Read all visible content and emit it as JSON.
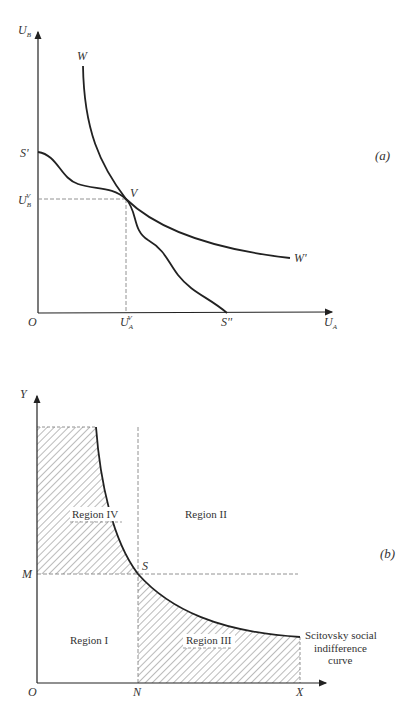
{
  "panel_a": {
    "tag": "(a)",
    "y_axis_label": "U",
    "y_axis_sub": "B",
    "x_axis_label": "U",
    "x_axis_sub": "A",
    "origin": "O",
    "curve_w_start": "W",
    "curve_w_end": "W'",
    "frontier_start": "S'",
    "frontier_end": "S''",
    "point_v": "V",
    "ub_v_label": "U",
    "ub_v_sub": "B",
    "ub_v_sup": "V",
    "ua_v_label": "U",
    "ua_v_sub": "A",
    "ua_v_sup": "V"
  },
  "panel_b": {
    "tag": "(b)",
    "y_axis_label": "Y",
    "x_axis_label": "X",
    "origin": "O",
    "m_label": "M",
    "n_label": "N",
    "point_s": "S",
    "region_1": "Region I",
    "region_2": "Region II",
    "region_3": "Region III",
    "region_4": "Region IV",
    "curve_label_line1": "Scitovsky social",
    "curve_label_line2": "indifference",
    "curve_label_line3": "curve"
  },
  "colors": {
    "ink": "#222222",
    "hatch": "#555555",
    "dash": "#777777"
  }
}
